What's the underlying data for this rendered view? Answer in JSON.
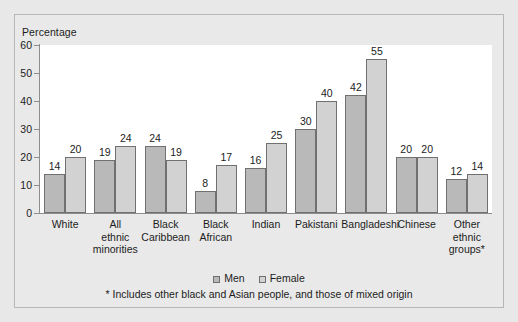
{
  "chart_data": {
    "type": "bar",
    "title": "",
    "ylabel": "Percentage",
    "xlabel": "",
    "ylim": [
      0,
      60
    ],
    "yticks": [
      0,
      10,
      20,
      30,
      40,
      50,
      60
    ],
    "grid": false,
    "legend_position": "bottom",
    "categories": [
      "White",
      "All ethnic minorities",
      "Black Caribbean",
      "Black African",
      "Indian",
      "Pakistani",
      "Bangladeshi",
      "Chinese",
      "Other ethnic groups*"
    ],
    "category_lines": [
      [
        "White"
      ],
      [
        "All",
        "ethnic",
        "minorities"
      ],
      [
        "Black",
        "Caribbean"
      ],
      [
        "Black",
        "African"
      ],
      [
        "Indian"
      ],
      [
        "Pakistani"
      ],
      [
        "Bangladeshi"
      ],
      [
        "Chinese"
      ],
      [
        "Other",
        "ethnic",
        "groups*"
      ]
    ],
    "series": [
      {
        "name": "Men",
        "color": "#b9b9b9",
        "values": [
          14,
          19,
          24,
          8,
          16,
          30,
          42,
          20,
          12
        ]
      },
      {
        "name": "Female",
        "color": "#d2d2d2",
        "values": [
          20,
          24,
          19,
          17,
          25,
          40,
          55,
          20,
          14
        ]
      }
    ],
    "annotations": [
      "* Includes other black and Asian people, and those of mixed origin"
    ]
  },
  "legend": {
    "entries": [
      {
        "label": "Men"
      },
      {
        "label": "Female"
      }
    ]
  },
  "footnote": {
    "text": "* Includes other black and Asian people, and those of mixed origin"
  }
}
